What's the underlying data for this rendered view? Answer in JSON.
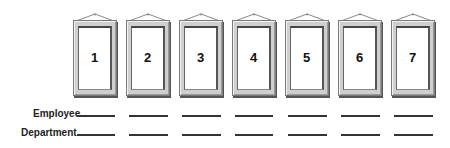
{
  "frames": [
    {
      "number": "1",
      "left": 73
    },
    {
      "number": "2",
      "left": 126
    },
    {
      "number": "3",
      "left": 179
    },
    {
      "number": "4",
      "left": 232
    },
    {
      "number": "5",
      "left": 285
    },
    {
      "number": "6",
      "left": 338
    },
    {
      "number": "7",
      "left": 391
    }
  ],
  "labels": {
    "employee": "Employee",
    "department": "Department"
  },
  "blanks": {
    "employee_y": 115,
    "department_y": 134,
    "segments": [
      [
        77,
        115
      ],
      [
        129,
        168
      ],
      [
        182,
        221
      ],
      [
        235,
        273
      ],
      [
        288,
        327
      ],
      [
        341,
        380
      ],
      [
        394,
        433
      ]
    ]
  }
}
